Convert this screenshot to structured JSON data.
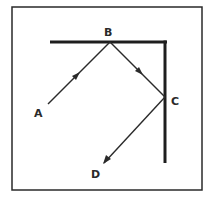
{
  "diagram": {
    "type": "reflection-path",
    "colors": {
      "line": "#2a2a2a",
      "wall": "#1e1e1e",
      "background": "#ffffff"
    },
    "frame": {
      "x": 12,
      "y": 7,
      "width": 190,
      "height": 183
    },
    "walls": [
      {
        "name": "top-wall",
        "x1": 50,
        "y1": 42,
        "x2": 167,
        "y2": 42
      },
      {
        "name": "right-wall",
        "x1": 165,
        "y1": 42,
        "x2": 165,
        "y2": 163
      }
    ],
    "points": [
      {
        "id": "A",
        "label": "A",
        "x": 48,
        "y": 104,
        "label_x": 34,
        "label_y": 117
      },
      {
        "id": "B",
        "label": "B",
        "x": 110,
        "y": 42,
        "label_x": 104,
        "label_y": 36
      },
      {
        "id": "C",
        "label": "C",
        "x": 165,
        "y": 97,
        "label_x": 171,
        "label_y": 105
      },
      {
        "id": "D",
        "label": "D",
        "x": 104,
        "y": 163,
        "label_x": 91,
        "label_y": 178
      }
    ],
    "segments": [
      {
        "from": "A",
        "to": "B",
        "arrow_at": 0.45
      },
      {
        "from": "B",
        "to": "C",
        "arrow_at": 0.55
      },
      {
        "from": "C",
        "to": "D",
        "arrow_at": 1.0
      }
    ]
  }
}
